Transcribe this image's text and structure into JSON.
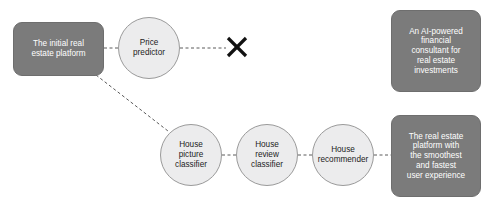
{
  "diagram": {
    "type": "flow-diagram",
    "background_color": "#ffffff",
    "box_fill_color": "#7b7b7b",
    "box_text_color": "#ffffff",
    "circle_fill_color": "#ececed",
    "circle_stroke_color": "#9a9a9a",
    "circle_text_color": "#1c1c1c",
    "edge_color": "#5a5a5a",
    "edge_style": "dashed",
    "cross_color": "#111111",
    "nodes": [
      {
        "id": "initial-platform",
        "shape": "rounded-rect",
        "label": "The initial real\nestate platform",
        "x": 13,
        "y": 22,
        "width": 91,
        "height": 54
      },
      {
        "id": "price-predictor",
        "shape": "circle",
        "label": "Price\npredictor",
        "x": 118,
        "y": 17,
        "width": 62,
        "height": 62
      },
      {
        "id": "ai-consultant",
        "shape": "rounded-rect",
        "label": "An AI-powered\nfinancial\nconsultant for\nreal estate\ninvestments",
        "x": 391,
        "y": 10,
        "width": 90,
        "height": 82
      },
      {
        "id": "house-picture-classifier",
        "shape": "circle",
        "label": "House\npicture\nclassifier",
        "x": 160,
        "y": 124,
        "width": 62,
        "height": 62
      },
      {
        "id": "house-review-classifier",
        "shape": "circle",
        "label": "House\nreview\nclassifier",
        "x": 236,
        "y": 124,
        "width": 62,
        "height": 62
      },
      {
        "id": "house-recommender",
        "shape": "circle",
        "label": "House\nrecommender",
        "x": 312,
        "y": 124,
        "width": 62,
        "height": 62
      },
      {
        "id": "smoothest-platform",
        "shape": "rounded-rect",
        "label": "The real estate\nplatform with\nthe smoothest\nand fastest\nuser experience",
        "x": 391,
        "y": 115,
        "width": 90,
        "height": 82
      }
    ],
    "edges": [
      {
        "id": "edge-platform-to-price",
        "from": "initial-platform",
        "to": "price-predictor",
        "x1": 104,
        "y1": 48,
        "x2": 118,
        "y2": 48
      },
      {
        "id": "edge-price-to-cross",
        "from": "price-predictor",
        "to": "cross-mark",
        "x1": 180,
        "y1": 48,
        "x2": 226,
        "y2": 48
      },
      {
        "id": "edge-platform-to-picture",
        "from": "initial-platform",
        "to": "house-picture-classifier",
        "x1": 96,
        "y1": 75,
        "x2": 168,
        "y2": 131
      },
      {
        "id": "edge-picture-to-review",
        "from": "house-picture-classifier",
        "to": "house-review-classifier",
        "x1": 222,
        "y1": 155,
        "x2": 236,
        "y2": 155
      },
      {
        "id": "edge-review-to-recommender",
        "from": "house-review-classifier",
        "to": "house-recommender",
        "x1": 298,
        "y1": 155,
        "x2": 312,
        "y2": 155
      },
      {
        "id": "edge-recommender-to-platform",
        "from": "house-recommender",
        "to": "smoothest-platform",
        "x1": 374,
        "y1": 155,
        "x2": 391,
        "y2": 155
      }
    ],
    "cross_mark": {
      "id": "cross-mark",
      "label": "X",
      "x": 224,
      "y": 34,
      "width": 26,
      "height": 26
    }
  }
}
